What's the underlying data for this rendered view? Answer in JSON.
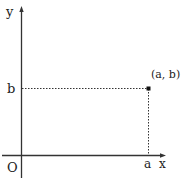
{
  "diagram": {
    "type": "coordinate-plane",
    "axes": {
      "x_label": "x",
      "y_label": "y",
      "origin_label": "O"
    },
    "point": {
      "label": "(a, b)",
      "x_label": "a",
      "y_label": "b"
    },
    "colors": {
      "axis": "#222222",
      "guide": "#222222",
      "point": "#111111"
    }
  }
}
